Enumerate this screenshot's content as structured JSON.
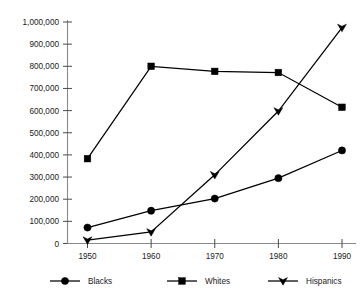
{
  "chart_data": {
    "type": "line",
    "title": "",
    "xlabel": "",
    "ylabel": "",
    "categories": [
      "1950",
      "1960",
      "1970",
      "1980",
      "1990"
    ],
    "x": [
      1950,
      1960,
      1970,
      1980,
      1990
    ],
    "ylim": [
      0,
      1000000
    ],
    "xlim": [
      1950,
      1990
    ],
    "ytick_values": [
      0,
      100000,
      200000,
      300000,
      400000,
      500000,
      600000,
      700000,
      800000,
      900000,
      1000000
    ],
    "ytick_labels": [
      "0",
      "100,000",
      "200,000",
      "300,000",
      "400,000",
      "500,000",
      "600,000",
      "700,000",
      "800,000",
      "900,000",
      "1,000,000"
    ],
    "xtick_labels": [
      "1950",
      "1960",
      "1970",
      "1980",
      "1990"
    ],
    "grid": false,
    "legend_position": "bottom",
    "series": [
      {
        "name": "Blacks",
        "marker": "circle",
        "color": "#000000",
        "values": [
          72000,
          148000,
          203000,
          295000,
          420000
        ]
      },
      {
        "name": "Whites",
        "marker": "square",
        "color": "#000000",
        "values": [
          383000,
          800000,
          777000,
          772000,
          615000
        ]
      },
      {
        "name": "Hispanics",
        "marker": "triangle",
        "color": "#000000",
        "values": [
          15000,
          52000,
          310000,
          598000,
          975000
        ]
      }
    ]
  },
  "legend": {
    "items": [
      {
        "label": "Blacks",
        "marker": "circle-marker-icon"
      },
      {
        "label": "Whites",
        "marker": "square-marker-icon"
      },
      {
        "label": "Hispanics",
        "marker": "triangle-marker-icon"
      }
    ]
  }
}
